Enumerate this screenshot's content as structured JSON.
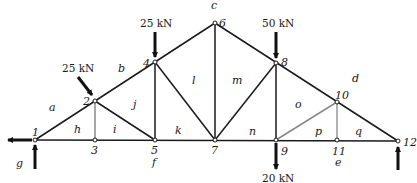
{
  "diagram": {
    "type": "truss",
    "nodes": [
      {
        "id": "1",
        "x": 35,
        "y": 140
      },
      {
        "id": "2",
        "x": 95,
        "y": 101
      },
      {
        "id": "3",
        "x": 95,
        "y": 140
      },
      {
        "id": "4",
        "x": 155,
        "y": 62
      },
      {
        "id": "5",
        "x": 155,
        "y": 140
      },
      {
        "id": "6",
        "x": 215,
        "y": 23
      },
      {
        "id": "7",
        "x": 215,
        "y": 140
      },
      {
        "id": "8",
        "x": 276,
        "y": 63
      },
      {
        "id": "9",
        "x": 276,
        "y": 140
      },
      {
        "id": "10",
        "x": 337,
        "y": 102
      },
      {
        "id": "11",
        "x": 337,
        "y": 140
      },
      {
        "id": "12",
        "x": 398,
        "y": 141
      }
    ],
    "node_labels": [
      "1",
      "2",
      "3",
      "4",
      "5",
      "6",
      "7",
      "8",
      "9",
      "10",
      "11",
      "12"
    ],
    "region_labels": [
      "a",
      "b",
      "c",
      "d",
      "e",
      "f",
      "g",
      "h",
      "i",
      "j",
      "k",
      "l",
      "m",
      "n",
      "o",
      "p",
      "q"
    ],
    "loads": {
      "node2": "25 kN",
      "node4": "25 kN",
      "node8": "50 kN",
      "node9": "20 kN"
    }
  }
}
